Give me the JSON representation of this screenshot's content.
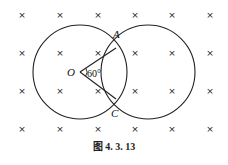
{
  "figure": {
    "caption": "图 4. 3. 13",
    "labels": {
      "O": "O",
      "A": "A",
      "C": "C",
      "angle": "60°"
    },
    "cross_symbol": "×",
    "cross_grid": {
      "xs": [
        22,
        60,
        98,
        135,
        172,
        210
      ],
      "ys": [
        15,
        53,
        91,
        129
      ]
    },
    "circles": [
      {
        "name": "left-circle",
        "cx": 80,
        "cy": 72,
        "r": 47
      },
      {
        "name": "right-circle",
        "cx": 148,
        "cy": 72,
        "r": 47
      }
    ],
    "points": {
      "O": [
        80,
        72
      ],
      "A": [
        116,
        48
      ],
      "C": [
        116,
        99
      ]
    },
    "colors": {
      "stroke": "#222222",
      "background": "#ffffff"
    }
  }
}
